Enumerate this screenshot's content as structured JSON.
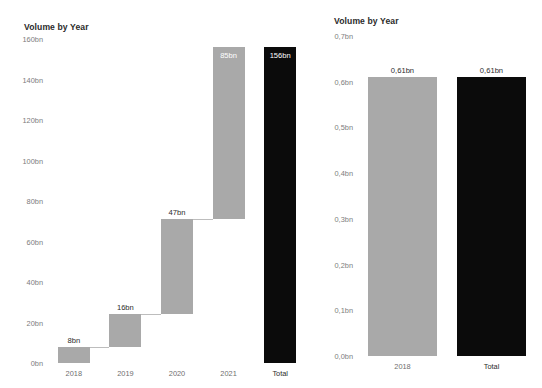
{
  "page": {
    "background": "#ffffff",
    "clipped_top_text": "",
    "clipped_bottom_text": ""
  },
  "colors": {
    "bar_gray": "#a9a9a9",
    "bar_total": "#0b0b0b",
    "axis_text": "#7d7d7d",
    "title_text": "#2b2b2b",
    "label_inside": "#ffffff",
    "label_above": "#2b2b2b"
  },
  "charts": [
    {
      "id": "volume-by-year-waterfall",
      "title": "Volume by Year"
    },
    {
      "id": "volume-by-year-bar",
      "title": "Volume by Year"
    }
  ],
  "chart_data": [
    {
      "type": "bar",
      "subtype": "waterfall",
      "title": "Volume by Year",
      "xlabel": "",
      "ylabel": "",
      "categories": [
        "2018",
        "2019",
        "2020",
        "2021",
        "Total"
      ],
      "values": [
        8,
        16,
        47,
        85,
        156
      ],
      "value_labels": [
        "8bn",
        "16bn",
        "47bn",
        "85bn",
        "156bn"
      ],
      "bar_kinds": [
        "delta",
        "delta",
        "delta",
        "delta",
        "total"
      ],
      "bar_bases": [
        0,
        8,
        24,
        71,
        0
      ],
      "bar_tops": [
        8,
        24,
        71,
        156,
        156
      ],
      "label_placement": [
        "above",
        "above",
        "above",
        "inside",
        "inside"
      ],
      "bar_colors": [
        "#a9a9a9",
        "#a9a9a9",
        "#a9a9a9",
        "#a9a9a9",
        "#0b0b0b"
      ],
      "ylim": [
        0,
        160
      ],
      "ytick_values": [
        0,
        20,
        40,
        60,
        80,
        100,
        120,
        140,
        160
      ],
      "ytick_labels": [
        "0bn",
        "20bn",
        "40bn",
        "60bn",
        "80bn",
        "100bn",
        "120bn",
        "140bn",
        "160bn"
      ],
      "grid": false,
      "legend": "none",
      "connectors": true,
      "units": "bn"
    },
    {
      "type": "bar",
      "subtype": "waterfall",
      "title": "Volume by Year",
      "xlabel": "",
      "ylabel": "",
      "categories": [
        "2018",
        "Total"
      ],
      "values": [
        0.61,
        0.61
      ],
      "value_labels": [
        "0,61bn",
        "0,61bn"
      ],
      "bar_kinds": [
        "delta",
        "total"
      ],
      "bar_bases": [
        0,
        0
      ],
      "bar_tops": [
        0.61,
        0.61
      ],
      "label_placement": [
        "above",
        "above"
      ],
      "bar_colors": [
        "#a9a9a9",
        "#0b0b0b"
      ],
      "ylim": [
        0,
        0.7
      ],
      "ytick_values": [
        0,
        0.1,
        0.2,
        0.3,
        0.4,
        0.5,
        0.6,
        0.7
      ],
      "ytick_labels": [
        "0,0bn",
        "0,1bn",
        "0,2bn",
        "0,3bn",
        "0,4bn",
        "0,5bn",
        "0,6bn",
        "0,7bn"
      ],
      "grid": false,
      "legend": "none",
      "connectors": false,
      "units": "bn"
    }
  ]
}
